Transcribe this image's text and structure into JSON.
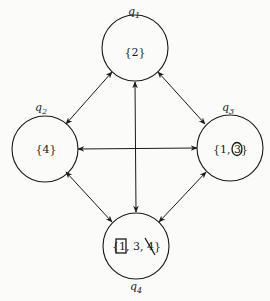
{
  "diagram": {
    "type": "complete-graph",
    "nodes": [
      {
        "id": "q1",
        "label_base": "q",
        "label_sub": "1",
        "set": "{2}"
      },
      {
        "id": "q2",
        "label_base": "q",
        "label_sub": "2",
        "set": "{4}"
      },
      {
        "id": "q3",
        "label_base": "q",
        "label_sub": "3",
        "set_open": "{1, ",
        "set_marked": "3",
        "set_close": "}",
        "marked_style": "circled"
      },
      {
        "id": "q4",
        "label_base": "q",
        "label_sub": "4",
        "set_open": "{",
        "set_boxed": "1",
        "set_mid": ", 3, ",
        "set_struck": "4",
        "set_close": "}",
        "boxed_style": "boxed",
        "struck_style": "struck-through"
      }
    ],
    "edges": [
      {
        "from": "q1",
        "to": "q2",
        "direction": "bidirectional"
      },
      {
        "from": "q1",
        "to": "q3",
        "direction": "bidirectional"
      },
      {
        "from": "q1",
        "to": "q4",
        "direction": "bidirectional"
      },
      {
        "from": "q2",
        "to": "q3",
        "direction": "bidirectional"
      },
      {
        "from": "q2",
        "to": "q4",
        "direction": "bidirectional"
      },
      {
        "from": "q3",
        "to": "q4",
        "direction": "bidirectional"
      }
    ]
  }
}
